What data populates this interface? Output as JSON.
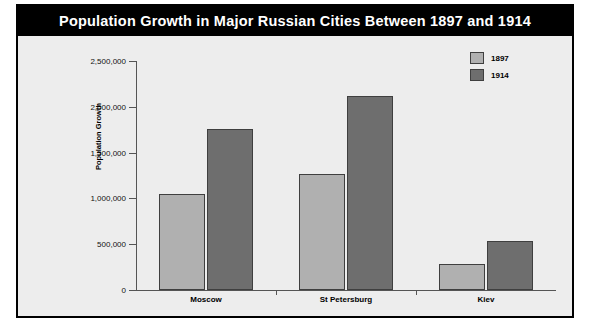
{
  "chart_data": {
    "type": "bar",
    "title": "Population Growth in Major Russian Cities Between 1897 and 1914",
    "xlabel": "",
    "ylabel": "Population Growth",
    "categories": [
      "Moscow",
      "St Petersburg",
      "Kiev"
    ],
    "series": [
      {
        "name": "1897",
        "color": "#b0b0b0",
        "values": [
          1050000,
          1265000,
          280000
        ]
      },
      {
        "name": "1914",
        "color": "#6e6e6e",
        "values": [
          1760000,
          2115000,
          530000
        ]
      }
    ],
    "ylim": [
      0,
      2500000
    ],
    "ytick_values": [
      0,
      500000,
      1000000,
      1500000,
      2000000,
      2500000
    ],
    "ytick_labels": [
      "0",
      "500,000",
      "1,000,000",
      "1,500,000",
      "2,000,000",
      "2,500,000"
    ],
    "grid": false,
    "legend_position": "top-right",
    "legend_entries": [
      "1897",
      "1914"
    ]
  },
  "figure": {
    "background_color": "#ededed",
    "border_color": "#000000",
    "title_bar_color": "#000000",
    "title_text_color": "#ffffff"
  }
}
